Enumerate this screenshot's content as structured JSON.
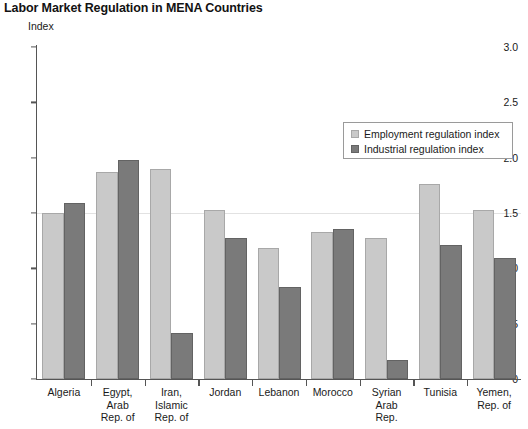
{
  "chart_data": {
    "type": "bar",
    "title": "Labor Market Regulation in MENA Countries",
    "ylabel": "Index",
    "xlabel": "",
    "ylim": [
      0,
      3.0
    ],
    "yticks": [
      "0",
      "0.5",
      "1.0",
      "1.5",
      "2.0",
      "2.5",
      "3.0"
    ],
    "ytick_values": [
      0,
      0.5,
      1.0,
      1.5,
      2.0,
      2.5,
      3.0
    ],
    "grid": "horizontal-faint-at-1.5",
    "legend_position": "upper-right-inside",
    "categories": [
      "Algeria",
      "Egypt,\nArab\nRep. of",
      "Iran,\nIslamic\nRep. of",
      "Jordan",
      "Lebanon",
      "Morocco",
      "Syrian\nArab\nRep.",
      "Tunisia",
      "Yemen,\nRep. of"
    ],
    "series": [
      {
        "name": "Employment regulation index",
        "color": "#c9c9c9",
        "values": [
          1.5,
          1.87,
          1.9,
          1.53,
          1.18,
          1.33,
          1.27,
          1.76,
          1.53
        ]
      },
      {
        "name": "Industrial regulation index",
        "color": "#7a7a7a",
        "values": [
          1.59,
          1.98,
          0.42,
          1.27,
          0.83,
          1.36,
          0.17,
          1.21,
          1.09
        ]
      }
    ]
  }
}
